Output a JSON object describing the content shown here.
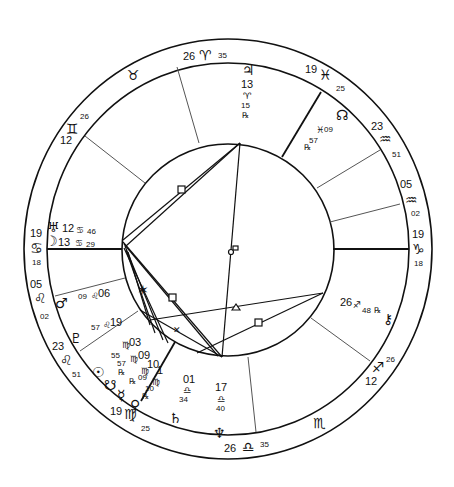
{
  "chart": {
    "type": "natal-wheel",
    "colors": {
      "ink": "#111111",
      "cusp_line": "#555555",
      "background": "#ffffff"
    }
  },
  "house_cusps": [
    {
      "id": "mc",
      "deg": "26",
      "sign": "aries",
      "glyph": "♈",
      "min": "35"
    },
    {
      "id": "c11",
      "deg": "19",
      "sign": "pisces",
      "glyph": "♓",
      "min": "25"
    },
    {
      "id": "c12",
      "deg": "23",
      "sign": "aquarius",
      "glyph": "♒",
      "min": "51"
    },
    {
      "id": "c12b",
      "deg": "05",
      "sign": "aquarius",
      "glyph": "♒",
      "min": "02"
    },
    {
      "id": "asc_r",
      "deg": "19",
      "sign": "capricorn",
      "glyph": "♑",
      "min": "18"
    },
    {
      "id": "c2",
      "deg": "12",
      "sign": "sagittarius",
      "glyph": "♐",
      "min": "26"
    },
    {
      "id": "ic",
      "deg": "26",
      "sign": "libra",
      "glyph": "♎",
      "min": "35"
    },
    {
      "id": "c5",
      "deg": "19",
      "sign": "virgo",
      "glyph": "♍",
      "min": "25"
    },
    {
      "id": "c6",
      "deg": "23",
      "sign": "leo",
      "glyph": "♌",
      "min": "51"
    },
    {
      "id": "c6b",
      "deg": "05",
      "sign": "leo",
      "glyph": "♌",
      "min": "02"
    },
    {
      "id": "asc_l",
      "deg": "19",
      "sign": "cancer",
      "glyph": "♋",
      "min": "18"
    },
    {
      "id": "c8",
      "deg": "12",
      "sign": "gemini",
      "glyph": "♊",
      "min": "26"
    }
  ],
  "intercepted_signs": [
    {
      "sign": "taurus",
      "glyph": "♉"
    },
    {
      "sign": "scorpio",
      "glyph": "♏"
    }
  ],
  "planets": [
    {
      "name": "jupiter",
      "glyph": "♃",
      "deg": "13",
      "sign_glyph": "♈",
      "min": "15",
      "retro": "℞"
    },
    {
      "name": "north-node",
      "glyph": "☊",
      "deg": "09",
      "sign_glyph": "♓",
      "min": "57",
      "retro": "℞"
    },
    {
      "name": "chiron",
      "glyph": "⚷",
      "deg": "26",
      "sign_glyph": "♐",
      "min": "48",
      "retro": "℞"
    },
    {
      "name": "uranus",
      "glyph": "♅",
      "deg": "12",
      "sign_glyph": "♋",
      "min": "46"
    },
    {
      "name": "moon",
      "glyph": "☽",
      "deg": "13",
      "sign_glyph": "♋",
      "min": "29"
    },
    {
      "name": "mars",
      "glyph": "♂",
      "deg": "06",
      "sign_glyph": "♌",
      "min": "09"
    },
    {
      "name": "pluto",
      "glyph": "♇",
      "deg": "19",
      "sign_glyph": "♌",
      "min": "57"
    },
    {
      "name": "sun",
      "glyph": "☉",
      "deg": "03",
      "sign_glyph": "♍",
      "min": "55"
    },
    {
      "name": "south-node",
      "glyph": "☋",
      "deg": "09",
      "sign_glyph": "♍",
      "min": "57",
      "retro": "℞"
    },
    {
      "name": "mercury",
      "glyph": "☿",
      "deg": "10",
      "sign_glyph": "♍",
      "min": "09",
      "retro": "℞"
    },
    {
      "name": "venus",
      "glyph": "♀",
      "deg": "1",
      "sign_glyph": "♍",
      "min": "10",
      "retro": "℞"
    },
    {
      "name": "saturn",
      "glyph": "♄",
      "deg": "01",
      "sign_glyph": "♎",
      "min": "34"
    },
    {
      "name": "neptune",
      "glyph": "♆",
      "deg": "17",
      "sign_glyph": "♎",
      "min": "40"
    }
  ],
  "aspect_symbols": [
    "□",
    "□",
    "☍",
    "△",
    "□",
    "✶",
    "⚹"
  ]
}
